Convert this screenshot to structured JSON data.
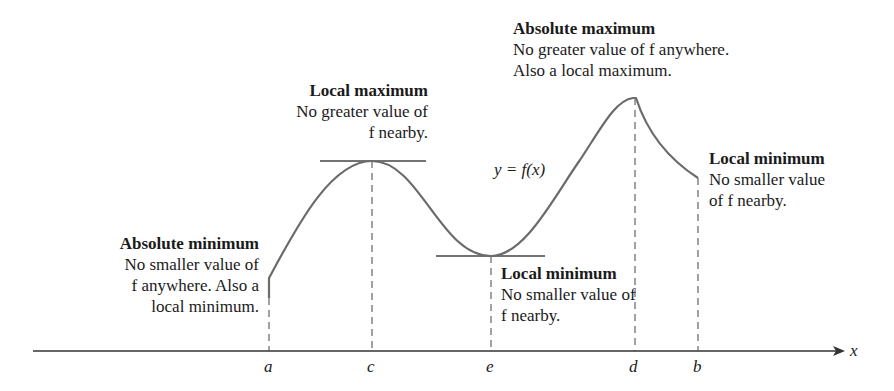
{
  "axis": {
    "x_label": "x"
  },
  "ticks": [
    {
      "name": "a",
      "label": "a"
    },
    {
      "name": "c",
      "label": "c"
    },
    {
      "name": "e",
      "label": "e"
    },
    {
      "name": "d",
      "label": "d"
    },
    {
      "name": "b",
      "label": "b"
    }
  ],
  "curve_label": "y = f(x)",
  "annotations": {
    "absolute_minimum": {
      "title": "Absolute minimum",
      "lines": [
        "No smaller value of",
        "f anywhere. Also a",
        "local minimum."
      ]
    },
    "local_maximum": {
      "title": "Local maximum",
      "lines": [
        "No greater value of",
        "f nearby."
      ]
    },
    "local_minimum_e": {
      "title": "Local minimum",
      "lines": [
        "No smaller value of",
        "f nearby."
      ]
    },
    "absolute_maximum": {
      "title": "Absolute maximum",
      "lines": [
        "No greater value of f anywhere.",
        "Also a local maximum."
      ]
    },
    "local_minimum_b": {
      "title": "Local minimum",
      "lines": [
        "No smaller value",
        "of f nearby."
      ]
    }
  },
  "colors": {
    "curve": "#6b6b6b",
    "axis": "#333333",
    "text": "#1a1a1a"
  }
}
